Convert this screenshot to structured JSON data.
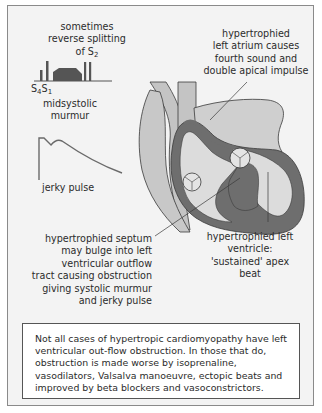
{
  "diagram": {
    "heart_sound_trace": {
      "caption_top": "sometimes\nreverse splitting\nof S",
      "caption_top_sub": "2",
      "sound_labels": [
        "S",
        "4",
        "S",
        "1"
      ],
      "caption_bottom": "midsystolic\nmurmur"
    },
    "pulse_trace": {
      "caption": "jerky pulse"
    },
    "annotations": {
      "left_atrium": "hypertrophied\nleft atrium causes\nfourth sound and\ndouble apical impulse",
      "septum": "hypertrophied septum\nmay bulge into left\nventricular outflow\ntract causing obstruction\ngiving systolic murmur\nand jerky pulse",
      "left_ventricle": "hypertrophied left\nventricle:\n'sustained' apex beat"
    },
    "note": "Not all cases of hypertropic cardiomyopathy have left ventricular out-flow obstruction. In those that do, obstruction is made worse by isoprenaline, vasodilators, Valsalva manoeuvre, ectopic beats and improved by beta blockers and vasoconstrictors.",
    "colors": {
      "background": "#f3f3f3",
      "muscle_dark": "#6e6e6e",
      "chamber_light": "#dcdcdc",
      "vessel_mid": "#c4c4c4",
      "outline": "#3a3a3a",
      "trace": "#6a6a6a"
    }
  }
}
